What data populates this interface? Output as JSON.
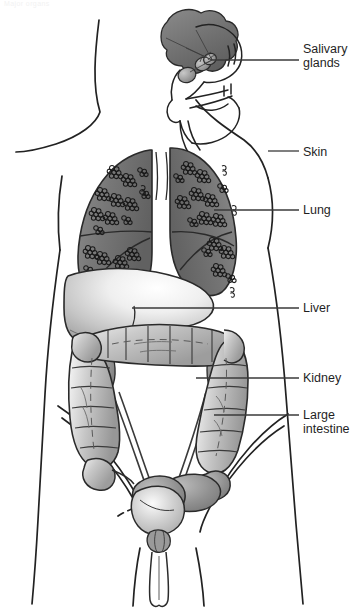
{
  "page": {
    "header_text": "Major organs",
    "background": "#ffffff",
    "ink": "#1f1f1f"
  },
  "figure": {
    "name": "human-torso-anatomy",
    "view": "anterior male torso, sagittal head inset",
    "outline_color": "#222222",
    "organ_fill_dark": "#6e6e6e",
    "organ_fill_mid": "#9a9a9a",
    "organ_fill_light": "#d8d8d8",
    "organ_fill_pale": "#f4f4f4"
  },
  "labels": [
    {
      "id": "salivary",
      "text": "Salivary\nglands",
      "leader_from_x": 212,
      "leader_from_y": 60,
      "leader_to_x": 299,
      "leader_to_y": 60,
      "target": "salivary-glands"
    },
    {
      "id": "skin",
      "text": "Skin",
      "leader_from_x": 268,
      "leader_from_y": 151,
      "leader_to_x": 299,
      "leader_to_y": 151,
      "target": "skin-outline"
    },
    {
      "id": "lung",
      "text": "Lung",
      "leader_from_x": 214,
      "leader_from_y": 210,
      "leader_to_x": 299,
      "leader_to_y": 210,
      "target": "right-lung"
    },
    {
      "id": "liver",
      "text": "Liver",
      "leader_from_x": 132,
      "leader_from_y": 308,
      "leader_to_x": 299,
      "leader_to_y": 308,
      "target": "liver"
    },
    {
      "id": "kidney",
      "text": "Kidney",
      "leader_from_x": 196,
      "leader_from_y": 378,
      "leader_to_x": 299,
      "leader_to_y": 378,
      "target": "kidney"
    },
    {
      "id": "large-intestine",
      "text": "Large\nintestine",
      "leader_from_x": 214,
      "leader_from_y": 415,
      "leader_to_x": 299,
      "leader_to_y": 415,
      "target": "large-intestine"
    }
  ],
  "organs": [
    {
      "id": "salivary-glands",
      "label": "Salivary glands",
      "count": 3,
      "shading": "mid-gray gradient ovals"
    },
    {
      "id": "brain-mass",
      "label": "Brain",
      "shading": "dark gray lobed mass"
    },
    {
      "id": "skin-outline",
      "label": "Skin",
      "shading": "outline only"
    },
    {
      "id": "left-lung",
      "label": "Lung (left)",
      "shading": "gray gradient with alveolar clusters"
    },
    {
      "id": "right-lung",
      "label": "Lung (right)",
      "shading": "gray gradient with alveolar clusters"
    },
    {
      "id": "liver",
      "label": "Liver",
      "shading": "pale gradient, large right lobe"
    },
    {
      "id": "large-intestine",
      "label": "Large intestine",
      "shading": "haustrated gray frame colon"
    },
    {
      "id": "kidney",
      "label": "Kidney",
      "count": 2,
      "shading": "bean shape behind colon"
    },
    {
      "id": "bladder",
      "label": "Bladder",
      "shading": "pale rounded sac"
    },
    {
      "id": "prostate",
      "label": "Prostate",
      "shading": "small gray body"
    },
    {
      "id": "urethra",
      "label": "Urethra / penis",
      "shading": "outline tube"
    }
  ]
}
